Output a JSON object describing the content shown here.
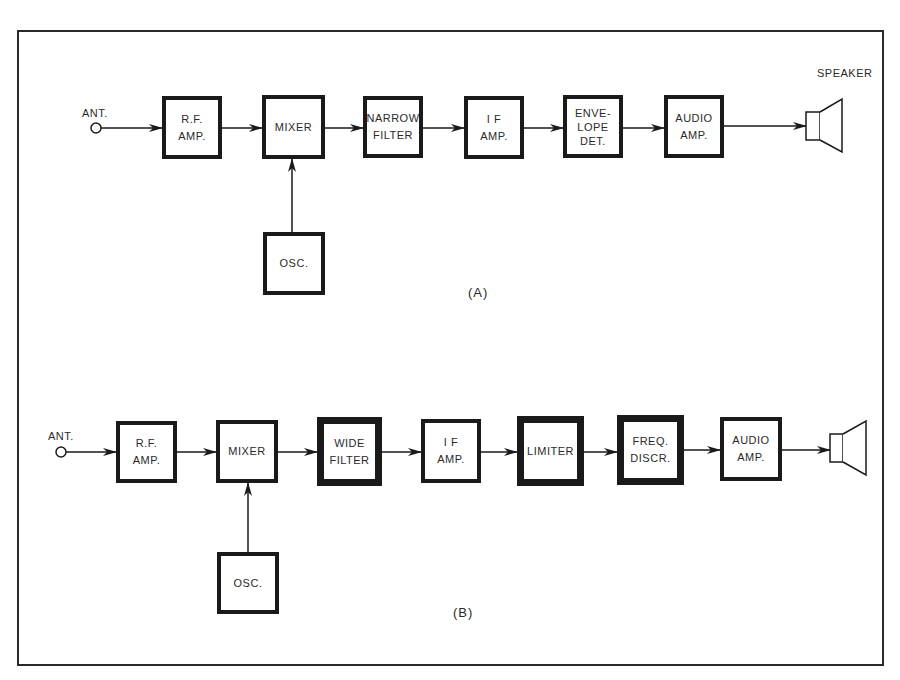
{
  "diagram": {
    "A": {
      "caption": "(A)",
      "antenna_label": "ANT.",
      "speaker_label": "SPEAKER",
      "blocks": [
        {
          "id": "rf_amp",
          "lines": [
            "R.F.",
            "AMP."
          ],
          "emphasis": false
        },
        {
          "id": "mixer",
          "lines": [
            "MIXER"
          ],
          "emphasis": false
        },
        {
          "id": "narrow_filter",
          "lines": [
            "NARROW",
            "FILTER"
          ],
          "emphasis": false
        },
        {
          "id": "if_amp",
          "lines": [
            "I F",
            "AMP."
          ],
          "emphasis": false
        },
        {
          "id": "envelope_det",
          "lines": [
            "ENVE-",
            "LOPE",
            "DET."
          ],
          "emphasis": false
        },
        {
          "id": "audio_amp",
          "lines": [
            "AUDIO",
            "AMP."
          ],
          "emphasis": false
        },
        {
          "id": "osc",
          "lines": [
            "OSC."
          ],
          "emphasis": false
        }
      ],
      "signal_chain": [
        "ANT.",
        "R.F. AMP.",
        "MIXER",
        "NARROW FILTER",
        "I F AMP.",
        "ENVELOPE DET.",
        "AUDIO AMP.",
        "SPEAKER"
      ],
      "side_inputs": [
        {
          "from": "OSC.",
          "to": "MIXER"
        }
      ]
    },
    "B": {
      "caption": "(B)",
      "antenna_label": "ANT.",
      "blocks": [
        {
          "id": "rf_amp",
          "lines": [
            "R.F.",
            "AMP."
          ],
          "emphasis": false
        },
        {
          "id": "mixer",
          "lines": [
            "MIXER"
          ],
          "emphasis": false
        },
        {
          "id": "wide_filter",
          "lines": [
            "WIDE",
            "FILTER"
          ],
          "emphasis": true
        },
        {
          "id": "if_amp",
          "lines": [
            "I F",
            "AMP."
          ],
          "emphasis": false
        },
        {
          "id": "limiter",
          "lines": [
            "LIMITER"
          ],
          "emphasis": true
        },
        {
          "id": "freq_discr",
          "lines": [
            "FREQ.",
            "DISCR."
          ],
          "emphasis": true
        },
        {
          "id": "audio_amp",
          "lines": [
            "AUDIO",
            "AMP."
          ],
          "emphasis": false
        },
        {
          "id": "osc",
          "lines": [
            "OSC."
          ],
          "emphasis": false
        }
      ],
      "signal_chain": [
        "ANT.",
        "R.F. AMP.",
        "MIXER",
        "WIDE FILTER",
        "I F AMP.",
        "LIMITER",
        "FREQ. DISCR.",
        "AUDIO AMP.",
        "SPEAKER"
      ],
      "side_inputs": [
        {
          "from": "OSC.",
          "to": "MIXER"
        }
      ]
    },
    "colors": {
      "ink": "#1a1a1a",
      "background": "#ffffff"
    }
  }
}
